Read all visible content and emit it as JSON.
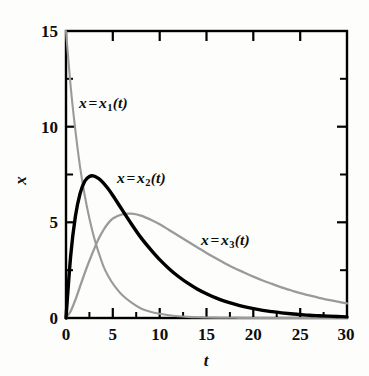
{
  "chart_data": {
    "type": "line",
    "title": "",
    "xlabel": "t",
    "ylabel": "x",
    "xlim": [
      0,
      30
    ],
    "ylim": [
      0,
      15
    ],
    "grid": false,
    "legend_position": "inline-annotations",
    "xticks": [
      "0",
      "5",
      "10",
      "15",
      "20",
      "25",
      "30"
    ],
    "xtick_values": [
      0,
      5,
      10,
      15,
      20,
      25,
      30
    ],
    "yticks": [
      "0",
      "5",
      "10",
      "15"
    ],
    "ytick_values": [
      0,
      5,
      10,
      15
    ],
    "x_minor_ticks": [
      2.5,
      7.5,
      12.5,
      17.5,
      22.5,
      27.5
    ],
    "y_minor_ticks": [
      2.5,
      7.5,
      12.5
    ],
    "x": [
      0,
      0.5,
      1,
      1.5,
      2,
      2.5,
      3,
      3.5,
      4,
      4.5,
      5,
      6,
      7,
      8,
      9,
      10,
      11,
      12,
      13,
      14,
      15,
      16,
      17,
      18,
      19,
      20,
      21,
      22,
      23,
      24,
      25,
      26,
      27,
      28,
      29,
      30
    ],
    "series": [
      {
        "name": "x = x_1(t)",
        "label": "x = x₁(t)",
        "color": "#9a9a9a",
        "style": "thin-gray",
        "values": [
          15.0,
          12.1,
          9.8,
          7.9,
          6.4,
          5.2,
          4.2,
          3.4,
          2.7,
          2.2,
          1.8,
          1.2,
          0.8,
          0.5,
          0.33,
          0.22,
          0.14,
          0.09,
          0.06,
          0.04,
          0.03,
          0.02,
          0.01,
          0.01,
          0.0,
          0.0,
          0.0,
          0.0,
          0.0,
          0.0,
          0.0,
          0.0,
          0.0,
          0.0,
          0.0,
          0.0
        ]
      },
      {
        "name": "x = x_2(t)",
        "label": "x = x₂(t)",
        "color": "#000000",
        "style": "bold-black",
        "values": [
          0.0,
          3.25,
          5.3,
          6.5,
          7.15,
          7.4,
          7.42,
          7.28,
          7.05,
          6.75,
          6.4,
          5.65,
          4.9,
          4.2,
          3.6,
          3.05,
          2.58,
          2.17,
          1.82,
          1.52,
          1.27,
          1.05,
          0.87,
          0.72,
          0.59,
          0.49,
          0.4,
          0.33,
          0.27,
          0.22,
          0.18,
          0.14,
          0.12,
          0.1,
          0.08,
          0.06
        ]
      },
      {
        "name": "x = x_3(t)",
        "label": "x = x₃(t)",
        "color": "#9a9a9a",
        "style": "thin-gray",
        "values": [
          0.0,
          0.35,
          0.95,
          1.65,
          2.35,
          3.0,
          3.6,
          4.15,
          4.6,
          4.95,
          5.2,
          5.42,
          5.45,
          5.35,
          5.15,
          4.9,
          4.6,
          4.3,
          4.0,
          3.7,
          3.4,
          3.12,
          2.85,
          2.6,
          2.38,
          2.16,
          1.96,
          1.78,
          1.6,
          1.45,
          1.3,
          1.18,
          1.05,
          0.95,
          0.85,
          0.76
        ]
      }
    ]
  },
  "axes": {
    "x_title": "t",
    "y_title": "x",
    "x_tick_labels": [
      "0",
      "5",
      "10",
      "15",
      "20",
      "25",
      "30"
    ],
    "y_tick_labels": [
      "0",
      "5",
      "10",
      "15"
    ]
  },
  "annotations": {
    "x1": {
      "prefix": "x",
      "eq": "=",
      "base": "x",
      "sub": "1",
      "suffix": "(t)"
    },
    "x2": {
      "prefix": "x",
      "eq": "=",
      "base": "x",
      "sub": "2",
      "suffix": "(t)"
    },
    "x3": {
      "prefix": "x",
      "eq": "=",
      "base": "x",
      "sub": "3",
      "suffix": "(t)"
    }
  },
  "colors": {
    "axis": "#000000",
    "bold_curve": "#000000",
    "gray_curve": "#9a9a9a",
    "background": "#fdfdfc",
    "text": "#0d0d0d"
  }
}
